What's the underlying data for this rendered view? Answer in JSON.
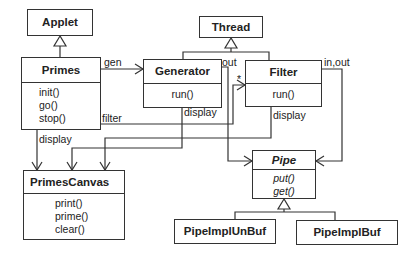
{
  "diagram": {
    "type": "uml-class-diagram",
    "classes": {
      "applet": {
        "name": "Applet"
      },
      "thread": {
        "name": "Thread"
      },
      "primes": {
        "name": "Primes",
        "ops": [
          "init()",
          "go()",
          "stop()"
        ]
      },
      "generator": {
        "name": "Generator",
        "ops": [
          "run()"
        ]
      },
      "filter": {
        "name": "Filter",
        "ops": [
          "run()"
        ]
      },
      "primes_canvas": {
        "name": "PrimesCanvas",
        "ops": [
          "print()",
          "prime()",
          "clear()"
        ]
      },
      "pipe": {
        "name": "Pipe",
        "abstract": true,
        "ops": [
          "put()",
          "get()"
        ]
      },
      "pipe_impl_unbuf": {
        "name": "PipeImplUnBuf"
      },
      "pipe_impl_buf": {
        "name": "PipeImplBuf"
      }
    },
    "labels": {
      "gen": "gen",
      "filter": "filter",
      "display_primes": "display",
      "display_generator": "display",
      "display_filter": "display",
      "out_generator": "out",
      "in_out_filter": "in,out",
      "multiplicity_star": "*"
    },
    "relations": [
      {
        "from": "Primes",
        "to": "Applet",
        "kind": "generalization"
      },
      {
        "from": "Generator",
        "to": "Thread",
        "kind": "generalization"
      },
      {
        "from": "Filter",
        "to": "Thread",
        "kind": "generalization"
      },
      {
        "from": "PipeImplUnBuf",
        "to": "Pipe",
        "kind": "generalization"
      },
      {
        "from": "PipeImplBuf",
        "to": "Pipe",
        "kind": "generalization"
      },
      {
        "from": "Primes",
        "to": "Generator",
        "kind": "association",
        "role": "gen"
      },
      {
        "from": "Primes",
        "to": "Filter",
        "kind": "association",
        "role": "filter",
        "multiplicity": "*"
      },
      {
        "from": "Primes",
        "to": "PrimesCanvas",
        "kind": "association",
        "role": "display"
      },
      {
        "from": "Generator",
        "to": "PrimesCanvas",
        "kind": "association",
        "role": "display"
      },
      {
        "from": "Filter",
        "to": "PrimesCanvas",
        "kind": "association",
        "role": "display"
      },
      {
        "from": "Generator",
        "to": "Pipe",
        "kind": "association",
        "role": "out"
      },
      {
        "from": "Filter",
        "to": "Pipe",
        "kind": "association",
        "role": "in,out"
      }
    ]
  },
  "colors": {
    "line": "#333333",
    "background": "#ffffff"
  }
}
